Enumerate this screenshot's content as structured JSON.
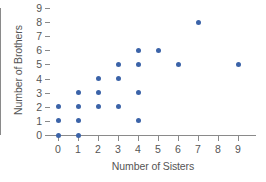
{
  "chart_data": {
    "type": "scatter",
    "title": "",
    "xlabel": "Number of Sisters",
    "ylabel": "Number of Brothers",
    "xlim": [
      0,
      9
    ],
    "ylim": [
      0,
      9
    ],
    "xticks": [
      "0",
      "1",
      "2",
      "3",
      "4",
      "5",
      "6",
      "7",
      "8",
      "9"
    ],
    "yticks": [
      "0",
      "1",
      "2",
      "3",
      "4",
      "5",
      "6",
      "7",
      "8",
      "9"
    ],
    "grid": false,
    "legend": "none",
    "marker_color": "#3b63a8",
    "axis_color": "#8a8a8a",
    "points": [
      {
        "x": 0,
        "y": 0
      },
      {
        "x": 0,
        "y": 1
      },
      {
        "x": 0,
        "y": 2
      },
      {
        "x": 1,
        "y": 0
      },
      {
        "x": 1,
        "y": 1
      },
      {
        "x": 1,
        "y": 2
      },
      {
        "x": 1,
        "y": 3
      },
      {
        "x": 2,
        "y": 2
      },
      {
        "x": 2,
        "y": 3
      },
      {
        "x": 2,
        "y": 4
      },
      {
        "x": 3,
        "y": 2
      },
      {
        "x": 3,
        "y": 4
      },
      {
        "x": 3,
        "y": 5
      },
      {
        "x": 4,
        "y": 1
      },
      {
        "x": 4,
        "y": 3
      },
      {
        "x": 4,
        "y": 5
      },
      {
        "x": 4,
        "y": 6
      },
      {
        "x": 5,
        "y": 6
      },
      {
        "x": 6,
        "y": 5
      },
      {
        "x": 7,
        "y": 8
      },
      {
        "x": 9,
        "y": 5
      }
    ]
  }
}
